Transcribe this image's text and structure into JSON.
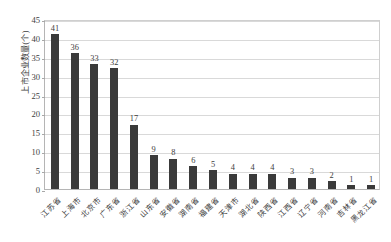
{
  "chart_data": {
    "type": "bar",
    "title": "",
    "subtitle": "",
    "xlabel": "",
    "ylabel": "上市企业数量(个)",
    "ylim": [
      0,
      45
    ],
    "ytick_step": 5,
    "yticks": [
      45,
      40,
      35,
      30,
      25,
      20,
      15,
      10,
      5,
      0
    ],
    "grid": true,
    "legend": false,
    "legend_position": "none",
    "bar_color": "#3a3a3a",
    "gridline_color": "#d9d9d9",
    "axis_color": "#b5b5b5",
    "data_labels": true,
    "categories": [
      "江苏省",
      "上海市",
      "北京市",
      "广东省",
      "浙江省",
      "山东省",
      "安徽省",
      "湖南省",
      "福建省",
      "天津市",
      "湖北省",
      "陕西省",
      "江西省",
      "辽宁省",
      "河南省",
      "吉林省",
      "黑龙江省"
    ],
    "values": [
      41,
      36,
      33,
      32,
      17,
      9,
      8,
      6,
      5,
      4,
      4,
      4,
      3,
      3,
      2,
      1,
      1
    ],
    "value_labels": [
      "41",
      "36",
      "33",
      "32",
      "17",
      "9",
      "8",
      "6",
      "5",
      "4",
      "4",
      "4",
      "3",
      "3",
      "2",
      "1",
      "1"
    ]
  }
}
